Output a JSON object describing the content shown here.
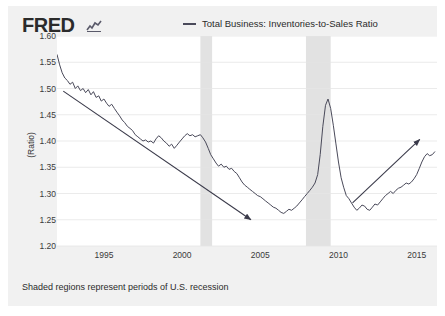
{
  "brand": {
    "logo_text": "FRED",
    "mark_icon": "line-chart-icon"
  },
  "legend": {
    "label": "Total Business: Inventories-to-Sales Ratio",
    "color": "#4a4a5a"
  },
  "footer": {
    "note": "Shaded regions represent periods of U.S. recession"
  },
  "chart_data": {
    "type": "line",
    "title": "",
    "xlabel": "",
    "ylabel": "(Ratio)",
    "ylim": [
      1.2,
      1.6
    ],
    "xlim": [
      1992.0,
      2016.3
    ],
    "grid": true,
    "legend_position": "top",
    "ytick_labels": [
      "1.60",
      "1.55",
      "1.50",
      "1.45",
      "1.40",
      "1.35",
      "1.30",
      "1.25",
      "1.20"
    ],
    "ytick_values": [
      1.6,
      1.55,
      1.5,
      1.45,
      1.4,
      1.35,
      1.3,
      1.25,
      1.2
    ],
    "xtick_labels": [
      "1995",
      "2000",
      "2005",
      "2010",
      "2015"
    ],
    "xtick_values": [
      1995,
      2000,
      2005,
      2010,
      2015
    ],
    "series": [
      {
        "name": "Total Business: Inventories-to-Sales Ratio",
        "color": "#4a4a5a",
        "x": [
          1992.0,
          1992.17,
          1992.33,
          1992.5,
          1992.67,
          1992.83,
          1993.0,
          1993.17,
          1993.33,
          1993.5,
          1993.67,
          1993.83,
          1994.0,
          1994.17,
          1994.33,
          1994.5,
          1994.67,
          1994.83,
          1995.0,
          1995.17,
          1995.33,
          1995.5,
          1995.67,
          1995.83,
          1996.0,
          1996.17,
          1996.33,
          1996.5,
          1996.67,
          1996.83,
          1997.0,
          1997.17,
          1997.33,
          1997.5,
          1997.67,
          1997.83,
          1998.0,
          1998.17,
          1998.33,
          1998.5,
          1998.67,
          1998.83,
          1999.0,
          1999.17,
          1999.33,
          1999.5,
          1999.67,
          1999.83,
          2000.0,
          2000.17,
          2000.33,
          2000.5,
          2000.67,
          2000.83,
          2001.0,
          2001.17,
          2001.33,
          2001.5,
          2001.67,
          2001.83,
          2002.0,
          2002.17,
          2002.33,
          2002.5,
          2002.67,
          2002.83,
          2003.0,
          2003.17,
          2003.33,
          2003.5,
          2003.67,
          2003.83,
          2004.0,
          2004.17,
          2004.33,
          2004.5,
          2004.67,
          2004.83,
          2005.0,
          2005.17,
          2005.33,
          2005.5,
          2005.67,
          2005.83,
          2006.0,
          2006.17,
          2006.33,
          2006.5,
          2006.67,
          2006.83,
          2007.0,
          2007.17,
          2007.33,
          2007.5,
          2007.67,
          2007.83,
          2008.0,
          2008.17,
          2008.33,
          2008.5,
          2008.67,
          2008.83,
          2009.0,
          2009.17,
          2009.33,
          2009.5,
          2009.67,
          2009.83,
          2010.0,
          2010.17,
          2010.33,
          2010.5,
          2010.67,
          2010.83,
          2011.0,
          2011.17,
          2011.33,
          2011.5,
          2011.67,
          2011.83,
          2012.0,
          2012.17,
          2012.33,
          2012.5,
          2012.67,
          2012.83,
          2013.0,
          2013.17,
          2013.33,
          2013.5,
          2013.67,
          2013.83,
          2014.0,
          2014.17,
          2014.33,
          2014.5,
          2014.67,
          2014.83,
          2015.0,
          2015.17,
          2015.33,
          2015.5,
          2015.67,
          2015.83,
          2016.0,
          2016.17
        ],
        "y": [
          1.565,
          1.545,
          1.53,
          1.52,
          1.515,
          1.508,
          1.512,
          1.5,
          1.505,
          1.496,
          1.5,
          1.492,
          1.498,
          1.488,
          1.494,
          1.483,
          1.486,
          1.476,
          1.48,
          1.472,
          1.466,
          1.47,
          1.462,
          1.455,
          1.448,
          1.44,
          1.435,
          1.428,
          1.424,
          1.42,
          1.412,
          1.408,
          1.404,
          1.4,
          1.402,
          1.398,
          1.4,
          1.396,
          1.404,
          1.41,
          1.406,
          1.4,
          1.396,
          1.39,
          1.394,
          1.386,
          1.392,
          1.398,
          1.404,
          1.41,
          1.414,
          1.41,
          1.412,
          1.408,
          1.41,
          1.412,
          1.406,
          1.398,
          1.386,
          1.374,
          1.366,
          1.358,
          1.352,
          1.356,
          1.35,
          1.352,
          1.346,
          1.348,
          1.342,
          1.338,
          1.33,
          1.322,
          1.316,
          1.312,
          1.308,
          1.304,
          1.3,
          1.296,
          1.294,
          1.29,
          1.286,
          1.282,
          1.278,
          1.274,
          1.272,
          1.268,
          1.264,
          1.262,
          1.266,
          1.27,
          1.268,
          1.272,
          1.276,
          1.282,
          1.288,
          1.294,
          1.3,
          1.306,
          1.312,
          1.32,
          1.336,
          1.374,
          1.428,
          1.468,
          1.48,
          1.462,
          1.43,
          1.396,
          1.36,
          1.33,
          1.312,
          1.296,
          1.29,
          1.282,
          1.274,
          1.268,
          1.272,
          1.278,
          1.276,
          1.27,
          1.268,
          1.274,
          1.28,
          1.278,
          1.284,
          1.29,
          1.296,
          1.3,
          1.304,
          1.3,
          1.306,
          1.31,
          1.312,
          1.316,
          1.32,
          1.318,
          1.322,
          1.328,
          1.336,
          1.348,
          1.36,
          1.37,
          1.376,
          1.372,
          1.374,
          1.38
        ]
      }
    ],
    "recession_bands": [
      {
        "start": 2001.17,
        "end": 2001.92,
        "label": "2001 recession"
      },
      {
        "start": 2007.92,
        "end": 2009.5,
        "label": "2008-2009 recession"
      }
    ],
    "annotations": [
      {
        "type": "arrow",
        "name": "downward-trend-arrow",
        "x1": 1992.4,
        "y1": 1.495,
        "x2": 2004.4,
        "y2": 1.25
      },
      {
        "type": "arrow",
        "name": "upward-trend-arrow",
        "x1": 2010.9,
        "y1": 1.282,
        "x2": 2015.2,
        "y2": 1.403
      }
    ]
  }
}
